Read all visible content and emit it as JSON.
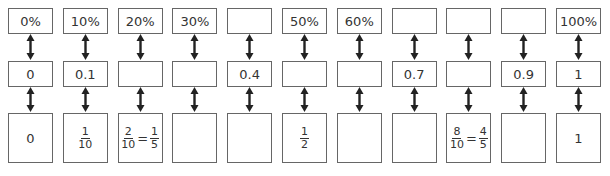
{
  "columns": [
    {
      "percent": "0%",
      "decimal": "0",
      "fraction": {
        "type": "text",
        "value": "0"
      }
    },
    {
      "percent": "10%",
      "decimal": "0.1",
      "fraction": {
        "type": "frac",
        "num": "1",
        "den": "10"
      }
    },
    {
      "percent": "20%",
      "decimal": "",
      "fraction": {
        "type": "eqfrac",
        "num": "2",
        "den": "10",
        "num2": "1",
        "den2": "5",
        "eq": "="
      }
    },
    {
      "percent": "30%",
      "decimal": "",
      "fraction": {
        "type": "text",
        "value": ""
      }
    },
    {
      "percent": "",
      "decimal": "0.4",
      "fraction": {
        "type": "text",
        "value": ""
      }
    },
    {
      "percent": "50%",
      "decimal": "",
      "fraction": {
        "type": "frac",
        "num": "1",
        "den": "2"
      }
    },
    {
      "percent": "60%",
      "decimal": "",
      "fraction": {
        "type": "text",
        "value": ""
      }
    },
    {
      "percent": "",
      "decimal": "0.7",
      "fraction": {
        "type": "text",
        "value": ""
      }
    },
    {
      "percent": "",
      "decimal": "",
      "fraction": {
        "type": "eqfrac",
        "num": "8",
        "den": "10",
        "num2": "4",
        "den2": "5",
        "eq": "="
      }
    },
    {
      "percent": "",
      "decimal": "0.9",
      "fraction": {
        "type": "text",
        "value": ""
      }
    },
    {
      "percent": "100%",
      "decimal": "1",
      "fraction": {
        "type": "text",
        "value": "1"
      }
    }
  ],
  "colors": {
    "border": "#666666",
    "arrow": "#222222",
    "text": "#333333"
  }
}
